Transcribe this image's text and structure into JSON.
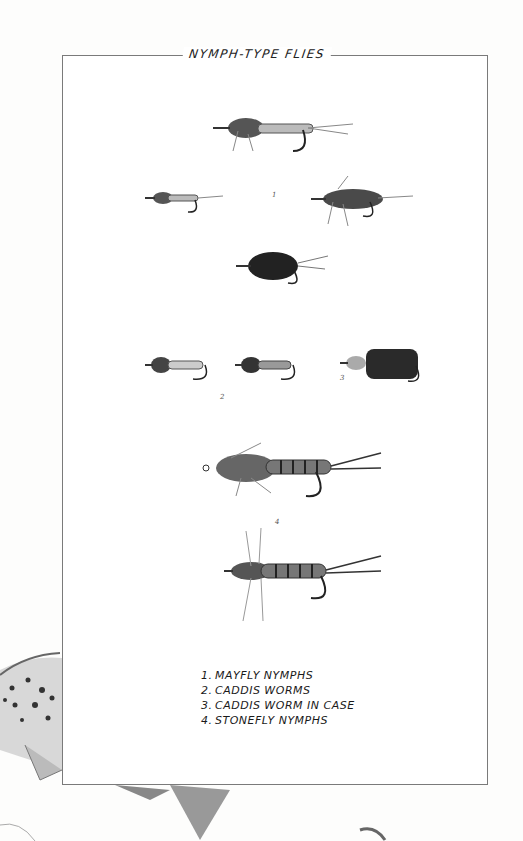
{
  "plate": {
    "title": "NYMPH-TYPE FLIES",
    "figure_numbers": [
      "1",
      "2",
      "3",
      "4"
    ],
    "legend": [
      {
        "number": "1.",
        "label": "MAYFLY NYMPHS"
      },
      {
        "number": "2.",
        "label": "CADDIS WORMS"
      },
      {
        "number": "3.",
        "label": "CADDIS WORM IN CASE"
      },
      {
        "number": "4.",
        "label": "STONEFLY NYMPHS"
      }
    ]
  },
  "colors": {
    "ink": "#1a1a1a",
    "frame": "#7a7a7a",
    "paper": "#ffffff"
  }
}
